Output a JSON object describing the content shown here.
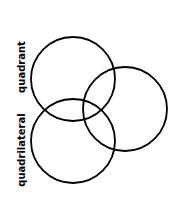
{
  "diagram": {
    "type": "venn",
    "labels": [
      {
        "text": "quadrant",
        "x": 25,
        "y": 67
      },
      {
        "text": "quadrilateral",
        "x": 25,
        "y": 150
      }
    ],
    "circles": [
      {
        "name": "top",
        "cx": 73,
        "cy": 79,
        "r": 42
      },
      {
        "name": "right",
        "cx": 125,
        "cy": 109,
        "r": 42
      },
      {
        "name": "bottom",
        "cx": 73,
        "cy": 141,
        "r": 42
      }
    ],
    "stroke": "#000000"
  }
}
